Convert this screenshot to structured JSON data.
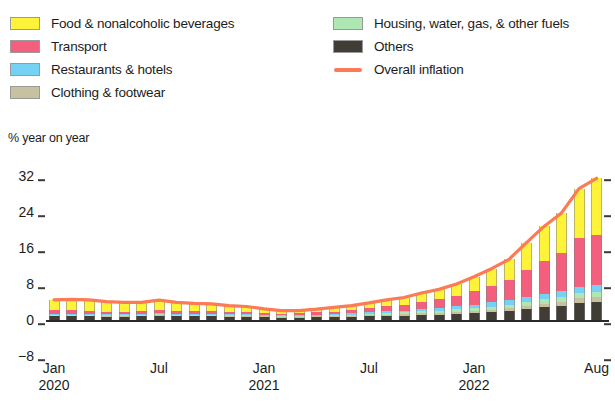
{
  "legend": {
    "left_column": [
      {
        "label": "Food & nonalcoholic beverages",
        "color": "#FFF339",
        "type": "swatch",
        "key": "food"
      },
      {
        "label": "Transport",
        "color": "#F55F7E",
        "type": "swatch",
        "key": "transport"
      },
      {
        "label": "Restaurants & hotels",
        "color": "#76D2F5",
        "type": "swatch",
        "key": "restaurants"
      },
      {
        "label": "Clothing & footwear",
        "color": "#C8C1A0",
        "type": "swatch",
        "key": "clothing"
      }
    ],
    "right_column": [
      {
        "label": "Housing, water, gas, & other fuels",
        "color": "#AEE7B4",
        "type": "swatch",
        "key": "housing"
      },
      {
        "label": "Others",
        "color": "#403C36",
        "type": "swatch",
        "key": "others"
      },
      {
        "label": "Overall inflation",
        "color": "#FC7A54",
        "type": "line",
        "key": "overall"
      }
    ]
  },
  "chart_data": {
    "type": "bar",
    "stacked": true,
    "title": "",
    "subtitle": "",
    "ylabel": "% year on year",
    "xlabel": "",
    "ylim": [
      -8,
      32
    ],
    "yticks": [
      32,
      24,
      16,
      8,
      0,
      -8
    ],
    "ytick_labels": [
      "32",
      "24",
      "16",
      "8",
      "0",
      "−8"
    ],
    "grid": false,
    "legend_position": "top",
    "x_tick_labels": [
      {
        "label": "Jan",
        "sub": "2020",
        "index": 0
      },
      {
        "label": "Jul",
        "sub": "",
        "index": 6
      },
      {
        "label": "Jan",
        "sub": "2021",
        "index": 12
      },
      {
        "label": "Jul",
        "sub": "",
        "index": 18
      },
      {
        "label": "Jan",
        "sub": "2022",
        "index": 24
      },
      {
        "label": "Aug",
        "sub": "",
        "index": 31
      }
    ],
    "categories": [
      "Jan 2020",
      "Feb 2020",
      "Mar 2020",
      "Apr 2020",
      "May 2020",
      "Jun 2020",
      "Jul 2020",
      "Aug 2020",
      "Sep 2020",
      "Oct 2020",
      "Nov 2020",
      "Dec 2020",
      "Jan 2021",
      "Feb 2021",
      "Mar 2021",
      "Apr 2021",
      "May 2021",
      "Jun 2021",
      "Jul 2021",
      "Aug 2021",
      "Sep 2021",
      "Oct 2021",
      "Nov 2021",
      "Dec 2021",
      "Jan 2022",
      "Feb 2022",
      "Mar 2022",
      "Apr 2022",
      "May 2022",
      "Jun 2022",
      "Jul 2022",
      "Aug 2022"
    ],
    "series": [
      {
        "name": "Others",
        "color": "#403C36",
        "values": [
          0.8,
          0.8,
          0.8,
          0.7,
          0.7,
          0.8,
          0.9,
          0.8,
          0.8,
          0.8,
          0.7,
          0.7,
          0.6,
          0.5,
          0.5,
          0.6,
          0.7,
          0.7,
          0.8,
          0.9,
          1.0,
          1.1,
          1.2,
          1.3,
          1.5,
          1.7,
          2.0,
          2.4,
          2.8,
          3.2,
          3.8,
          4.1
        ]
      },
      {
        "name": "Clothing & footwear",
        "color": "#C8C1A0",
        "values": [
          0.2,
          0.2,
          0.2,
          0.2,
          0.2,
          0.2,
          0.2,
          0.2,
          0.2,
          0.2,
          0.2,
          0.2,
          0.2,
          0.2,
          0.2,
          0.2,
          0.2,
          0.2,
          0.3,
          0.3,
          0.3,
          0.4,
          0.4,
          0.5,
          0.5,
          0.6,
          0.6,
          0.7,
          0.8,
          0.9,
          1.0,
          1.0
        ]
      },
      {
        "name": "Housing, water, gas, & other fuels",
        "color": "#AEE7B4",
        "values": [
          0.2,
          0.2,
          0.2,
          0.2,
          0.2,
          0.2,
          0.2,
          0.2,
          0.2,
          0.2,
          0.2,
          0.2,
          0.2,
          0.2,
          0.2,
          0.2,
          0.2,
          0.3,
          0.3,
          0.4,
          0.4,
          0.5,
          0.5,
          0.6,
          0.6,
          0.7,
          0.8,
          0.9,
          1.0,
          1.0,
          1.1,
          1.1
        ]
      },
      {
        "name": "Restaurants & hotels",
        "color": "#76D2F5",
        "values": [
          0.2,
          0.2,
          0.2,
          0.2,
          0.2,
          0.2,
          0.2,
          0.2,
          0.2,
          0.2,
          0.2,
          0.2,
          0.2,
          0.2,
          0.2,
          0.2,
          0.2,
          0.3,
          0.3,
          0.4,
          0.4,
          0.5,
          0.6,
          0.7,
          0.8,
          0.9,
          1.0,
          1.1,
          1.2,
          1.3,
          1.5,
          1.6
        ]
      },
      {
        "name": "Transport",
        "color": "#F55F7E",
        "values": [
          0.8,
          0.8,
          0.7,
          0.6,
          0.5,
          0.5,
          0.7,
          0.6,
          0.5,
          0.5,
          0.4,
          0.4,
          0.3,
          0.3,
          0.4,
          0.5,
          0.6,
          0.7,
          0.9,
          1.1,
          1.3,
          1.6,
          1.9,
          2.3,
          3.0,
          3.6,
          4.4,
          6.0,
          7.4,
          8.6,
          10.8,
          11.2
        ]
      },
      {
        "name": "Food & nonalcoholic beverages",
        "color": "#FFF339",
        "values": [
          2.3,
          2.4,
          2.4,
          2.2,
          2.1,
          2.0,
          2.2,
          1.9,
          1.8,
          1.7,
          1.5,
          1.3,
          1.0,
          0.7,
          0.6,
          0.7,
          0.9,
          1.0,
          1.2,
          1.4,
          1.6,
          1.9,
          2.2,
          2.6,
          3.2,
          3.9,
          4.7,
          6.1,
          7.6,
          8.8,
          11.0,
          12.5
        ]
      }
    ],
    "overall_inflation": {
      "name": "Overall inflation",
      "color": "#FC7A54",
      "values": [
        4.5,
        4.6,
        4.5,
        4.1,
        3.9,
        3.9,
        4.4,
        3.9,
        3.7,
        3.6,
        3.2,
        3.0,
        2.5,
        2.1,
        2.1,
        2.4,
        2.8,
        3.2,
        3.8,
        4.5,
        5.0,
        6.0,
        6.8,
        8.0,
        9.6,
        11.4,
        13.5,
        17.2,
        20.8,
        23.8,
        29.2,
        31.5
      ]
    }
  }
}
